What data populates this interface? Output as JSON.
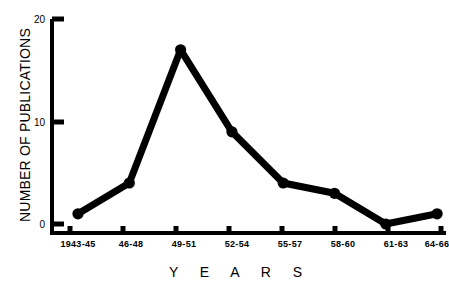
{
  "chart_data": {
    "type": "line",
    "title": "",
    "xlabel": "Y E A R S",
    "ylabel": "NUMBER OF PUBLICATIONS",
    "categories": [
      "1943-45",
      "46-48",
      "49-51",
      "52-54",
      "55-57",
      "58-60",
      "61-63",
      "64-66"
    ],
    "values": [
      1,
      4,
      17,
      9,
      4,
      3,
      0,
      1
    ],
    "series": [
      {
        "name": "Number of publications",
        "values": [
          1,
          4,
          17,
          9,
          4,
          3,
          0,
          1
        ]
      }
    ],
    "ylim": [
      0,
      20
    ],
    "ytick_values": [
      0,
      10,
      20
    ],
    "ytick_labels": [
      "0",
      "10",
      "20"
    ],
    "xtick_labels": [
      "1943-45",
      "46-48",
      "49-51",
      "52-54",
      "55-57",
      "58-60",
      "61-63",
      "64-66"
    ],
    "grid": false,
    "legend": false,
    "legend_position": "none",
    "line_color": "#000000",
    "marker": "circle",
    "marker_color": "#000000",
    "background_color": "#ffffff",
    "axis_color": "#000000"
  },
  "axes": {
    "y_title": "NUMBER OF PUBLICATIONS",
    "x_title": "Y E A R S",
    "y_ticks": [
      {
        "label": "20",
        "value": 20
      },
      {
        "label": "10",
        "value": 10
      },
      {
        "label": "0",
        "value": 0
      }
    ],
    "x_ticks": [
      {
        "label": "1943-45",
        "value": 1
      },
      {
        "label": "46-48",
        "value": 4
      },
      {
        "label": "49-51",
        "value": 17
      },
      {
        "label": "52-54",
        "value": 9
      },
      {
        "label": "55-57",
        "value": 4
      },
      {
        "label": "58-60",
        "value": 3
      },
      {
        "label": "61-63",
        "value": 0
      },
      {
        "label": "64-66",
        "value": 1
      }
    ]
  }
}
